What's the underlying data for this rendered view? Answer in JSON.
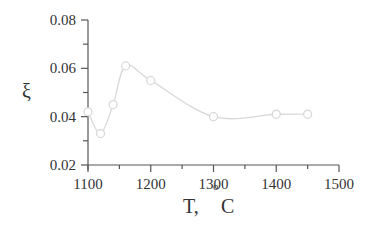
{
  "chart_data": {
    "type": "line",
    "title": "",
    "xlabel": "T,",
    "xlabel_unit_sup": "o",
    "xlabel_unit": "C",
    "ylabel": "ξ",
    "xlim": [
      1100,
      1500
    ],
    "ylim": [
      0.02,
      0.08
    ],
    "x_ticks": [
      1100,
      1200,
      1300,
      1400,
      1500
    ],
    "x_tick_labels": [
      "1100",
      "1200",
      "1300",
      "1400",
      "1500"
    ],
    "x_minor_ticks": [
      1150,
      1250,
      1350,
      1450
    ],
    "y_ticks": [
      0.02,
      0.04,
      0.06,
      0.08
    ],
    "y_tick_labels": [
      "0.02",
      "0.04",
      "0.06",
      "0.08"
    ],
    "y_minor_ticks": [
      0.03,
      0.05,
      0.07
    ],
    "grid": false,
    "series": [
      {
        "name": "ξ",
        "marker": "circle-open",
        "smooth": true,
        "color": "#d9d9d9",
        "x": [
          1100,
          1120,
          1140,
          1160,
          1200,
          1300,
          1400,
          1450
        ],
        "y": [
          0.042,
          0.033,
          0.045,
          0.061,
          0.055,
          0.04,
          0.041,
          0.041
        ]
      }
    ]
  }
}
